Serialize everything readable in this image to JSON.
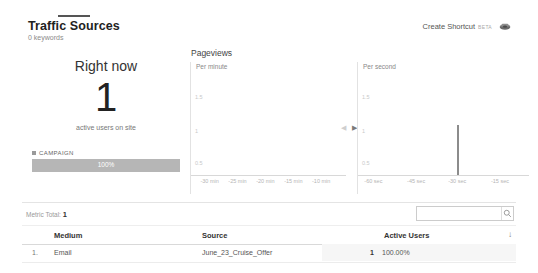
{
  "header": {
    "title": "Traffic Sources",
    "subtitle": "0 keywords",
    "shortcut_label": "Create Shortcut",
    "shortcut_badge": "BETA",
    "shortcut_icon": "share-icon"
  },
  "right_now": {
    "title": "Right now",
    "count": "1",
    "caption": "active users on site",
    "legend_label": "CAMPAIGN",
    "bar_label": "100%",
    "bar_color": "#b6b6b6"
  },
  "pageviews": {
    "title": "Pageviews",
    "nav_prev_icon": "chevron-left-icon",
    "nav_next_icon": "chevron-right-icon"
  },
  "chart_data": [
    {
      "type": "bar",
      "title": "Per minute",
      "xlabel": "",
      "ylabel": "",
      "x": [
        "-30 min",
        "-25 min",
        "-20 min",
        "-15 min",
        "-10 min"
      ],
      "tick_positions": [
        12,
        30,
        48,
        66,
        84
      ],
      "yticks": [
        "1.5",
        "1",
        "0.5"
      ],
      "ylim": [
        0,
        2
      ],
      "grid": false,
      "values": [],
      "categories": []
    },
    {
      "type": "bar",
      "title": "Per second",
      "xlabel": "",
      "ylabel": "",
      "x": [
        "-60 sec",
        "-45 sec",
        "-30 sec",
        "-15 sec"
      ],
      "tick_positions": [
        9,
        34,
        58,
        83
      ],
      "yticks": [
        "1.5",
        "1",
        "0.5"
      ],
      "ylim": [
        0,
        2
      ],
      "grid": false,
      "categories": [
        "-30 sec"
      ],
      "values": [
        1
      ],
      "bar_position_pct": 58,
      "bar_color": "#8c8c8c"
    }
  ],
  "table": {
    "metric_total_label": "Metric Total:",
    "metric_total_value": "1",
    "search_placeholder": "",
    "search_value": "",
    "search_icon": "search-icon",
    "sort_icon": "sort-descending-icon",
    "columns": [
      "Medium",
      "Source",
      "Active Users"
    ],
    "rows": [
      {
        "index": "1.",
        "medium": "Email",
        "source": "June_23_Cruise_Offer",
        "active_users": "1",
        "percent": "100.00%"
      }
    ]
  }
}
